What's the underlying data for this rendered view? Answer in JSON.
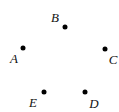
{
  "diagram": {
    "type": "points",
    "background": "#ffffff",
    "color": "#000000",
    "points": [
      {
        "label": "A",
        "dot": [
          23,
          48
        ],
        "label_pos": [
          14,
          58
        ]
      },
      {
        "label": "B",
        "dot": [
          65,
          27
        ],
        "label_pos": [
          55,
          17
        ]
      },
      {
        "label": "C",
        "dot": [
          105,
          49
        ],
        "label_pos": [
          113,
          59
        ]
      },
      {
        "label": "D",
        "dot": [
          85,
          92
        ],
        "label_pos": [
          94,
          103
        ]
      },
      {
        "label": "E",
        "dot": [
          44,
          92
        ],
        "label_pos": [
          33,
          102
        ]
      }
    ]
  }
}
